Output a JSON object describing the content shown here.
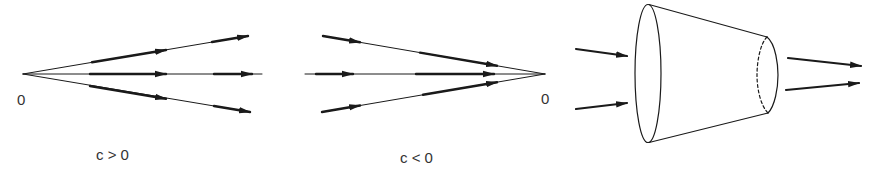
{
  "figure": {
    "stroke_color": "#1a1a1a",
    "text_color": "#333333",
    "background": "#ffffff"
  },
  "panels": [
    {
      "id": "diverging",
      "caption": "c > 0",
      "origin_label": "0",
      "description": "Three rays emanating from origin 0 with arrows pointing outward (away from origin)"
    },
    {
      "id": "converging",
      "caption": "c < 0",
      "origin_label": "0",
      "description": "Three rays converging toward origin 0 with arrows pointing inward (toward origin)"
    },
    {
      "id": "cone",
      "caption": "",
      "description": "Truncated cone (frustum) with two arrows entering the wide end and two arrows exiting the narrow end; hidden back edge of narrow end drawn dashed"
    }
  ]
}
